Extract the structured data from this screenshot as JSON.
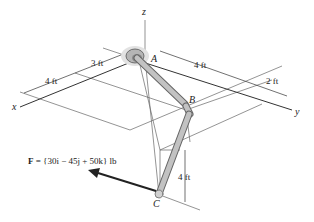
{
  "diagram": {
    "axes": {
      "x": "x",
      "y": "y",
      "z": "z"
    },
    "points": {
      "A": "A",
      "B": "B",
      "C": "C"
    },
    "dimensions": {
      "x_near": "4 ft",
      "x_far": "3 ft",
      "y_main": "4 ft",
      "y_extra": "2 ft",
      "vertical": "4 ft"
    },
    "force": {
      "label_prefix": "F",
      "label_rest": " = {30i − 45j + 50k} lb"
    },
    "colors": {
      "pipe": "#b9b9b9",
      "pipe_edge": "#6f6f6f",
      "support": "#c8c8c8",
      "lines": "#555555"
    }
  }
}
